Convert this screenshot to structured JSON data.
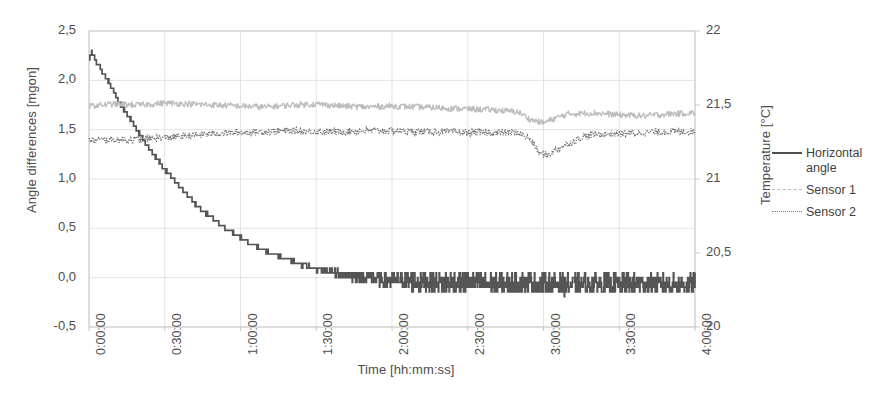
{
  "chart_data": {
    "type": "line",
    "title": "",
    "xlabel": "Time [hh:mm:ss]",
    "ylabel": "Angle differences [mgon]",
    "y2label": "Temperature [°C]",
    "grid": true,
    "legend_position": "right",
    "xlim": [
      0,
      14400
    ],
    "ylim": [
      -0.5,
      2.5
    ],
    "y2lim": [
      20,
      22
    ],
    "xticks": [
      "0:00:00",
      "0:30:00",
      "1:00:00",
      "1:30:00",
      "2:00:00",
      "2:30:00",
      "3:00:00",
      "3:30:00",
      "4:00:00"
    ],
    "xtick_seconds": [
      0,
      1800,
      3600,
      5400,
      7200,
      9000,
      10800,
      12600,
      14400
    ],
    "yticks": [
      "-0,5",
      "0,0",
      "0,5",
      "1,0",
      "1,5",
      "2,0",
      "2,5"
    ],
    "ytick_values": [
      -0.5,
      0.0,
      0.5,
      1.0,
      1.5,
      2.0,
      2.5
    ],
    "y2ticks": [
      "20",
      "20,5",
      "21",
      "21,5",
      "22"
    ],
    "y2tick_values": [
      20,
      20.5,
      21,
      21.5,
      22
    ],
    "colors": {
      "horizontal_angle": "#555555",
      "sensor1": "#bcbcbc",
      "sensor2": "#6f6f6f",
      "grid": "#e3e3e3",
      "axis": "#c8c8c8",
      "text": "#4d4d4d"
    },
    "series": [
      {
        "name": "Horizontal angle",
        "axis": "left",
        "style": "solid",
        "color": "#555555",
        "description": "Exponential decay from 2.28 mgon at t=0 settling to about -0.05 mgon noise band after ~1:45:00; quantized staircase steps of ~0.05 mgon.",
        "x": [
          0,
          60,
          120,
          180,
          240,
          300,
          360,
          420,
          480,
          540,
          600,
          660,
          720,
          780,
          840,
          900,
          960,
          1020,
          1080,
          1140,
          1200,
          1320,
          1440,
          1560,
          1680,
          1800,
          1920,
          2040,
          2160,
          2280,
          2400,
          2520,
          2640,
          2760,
          2880,
          3000,
          3120,
          3240,
          3360,
          3480,
          3600,
          3780,
          3960,
          4140,
          4320,
          4500,
          4680,
          4860,
          5040,
          5220,
          5400,
          5700,
          6000,
          6300,
          6600,
          6900,
          7200,
          7800,
          8400,
          9000,
          9600,
          10200,
          10800,
          11400,
          12000,
          12600,
          13200,
          13800,
          14400
        ],
        "y": [
          2.2,
          2.28,
          2.24,
          2.18,
          2.15,
          2.1,
          2.05,
          2.02,
          1.97,
          1.92,
          1.88,
          1.83,
          1.78,
          1.74,
          1.7,
          1.66,
          1.62,
          1.58,
          1.54,
          1.5,
          1.46,
          1.38,
          1.31,
          1.24,
          1.17,
          1.1,
          1.04,
          0.98,
          0.92,
          0.86,
          0.8,
          0.75,
          0.7,
          0.66,
          0.62,
          0.58,
          0.54,
          0.5,
          0.47,
          0.44,
          0.41,
          0.36,
          0.32,
          0.28,
          0.25,
          0.22,
          0.19,
          0.16,
          0.13,
          0.11,
          0.09,
          0.06,
          0.03,
          0.01,
          0.0,
          -0.02,
          -0.03,
          -0.04,
          -0.05,
          -0.05,
          -0.06,
          -0.05,
          -0.06,
          -0.07,
          -0.06,
          -0.07,
          -0.06,
          -0.07,
          -0.06
        ],
        "noise_band": 0.09
      },
      {
        "name": "Sensor 1",
        "axis": "right",
        "style": "dashed",
        "color": "#bcbcbc",
        "description": "Temperature sensor 1, noisy around 21.45 °C rising slightly to 21.5 °C; brief dip near 3:00:00.",
        "x": [
          0,
          600,
          1200,
          1800,
          2400,
          3000,
          3600,
          4200,
          4800,
          5400,
          6000,
          6600,
          7200,
          7800,
          8400,
          9000,
          9600,
          10200,
          10500,
          10800,
          11100,
          11400,
          12000,
          12600,
          13200,
          13800,
          14400
        ],
        "y_left_scale": [
          1.74,
          1.76,
          1.75,
          1.77,
          1.76,
          1.75,
          1.74,
          1.73,
          1.75,
          1.76,
          1.74,
          1.73,
          1.74,
          1.73,
          1.72,
          1.71,
          1.7,
          1.68,
          1.6,
          1.57,
          1.62,
          1.66,
          1.67,
          1.65,
          1.64,
          1.66,
          1.67
        ],
        "y_temp": [
          21.49,
          21.5,
          21.5,
          21.5,
          21.5,
          21.5,
          21.49,
          21.49,
          21.5,
          21.5,
          21.49,
          21.49,
          21.49,
          21.49,
          21.48,
          21.48,
          21.47,
          21.47,
          21.44,
          21.43,
          21.45,
          21.46,
          21.47,
          21.46,
          21.46,
          21.46,
          21.47
        ],
        "noise_band": 0.03
      },
      {
        "name": "Sensor 2",
        "axis": "right",
        "style": "dotted",
        "color": "#6f6f6f",
        "description": "Temperature sensor 2, noisy around 21.35 °C; pronounced dip to about 21.22 °C near 3:00:00 then recovery.",
        "x": [
          0,
          600,
          1200,
          1800,
          2400,
          3000,
          3600,
          4200,
          4800,
          5400,
          6000,
          6600,
          7200,
          7800,
          8400,
          9000,
          9600,
          10200,
          10500,
          10700,
          10900,
          11100,
          11400,
          11700,
          12000,
          12600,
          13200,
          13800,
          14400
        ],
        "y_left_scale": [
          1.39,
          1.4,
          1.4,
          1.42,
          1.44,
          1.46,
          1.47,
          1.48,
          1.49,
          1.48,
          1.48,
          1.49,
          1.49,
          1.48,
          1.48,
          1.47,
          1.47,
          1.47,
          1.4,
          1.26,
          1.24,
          1.3,
          1.36,
          1.42,
          1.45,
          1.46,
          1.47,
          1.48,
          1.48
        ],
        "y_temp": [
          21.33,
          21.33,
          21.33,
          21.34,
          21.35,
          21.35,
          21.36,
          21.36,
          21.36,
          21.36,
          21.36,
          21.36,
          21.36,
          21.36,
          21.36,
          21.36,
          21.36,
          21.36,
          21.33,
          21.28,
          21.27,
          21.29,
          21.32,
          21.34,
          21.35,
          21.36,
          21.36,
          21.36,
          21.36
        ],
        "noise_band": 0.035
      }
    ]
  },
  "legend": {
    "items": [
      {
        "label": "Horizontal angle",
        "style": "solid"
      },
      {
        "label": "Sensor 1",
        "style": "dashed"
      },
      {
        "label": "Sensor 2",
        "style": "dotted"
      }
    ]
  }
}
